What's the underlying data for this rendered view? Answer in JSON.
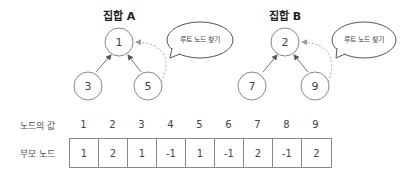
{
  "sets": [
    {
      "title": "집합 A",
      "root": "1",
      "children": [
        "3",
        "5"
      ],
      "bubble": "루트 노드 찾기"
    },
    {
      "title": "집합 B",
      "root": "2",
      "children": [
        "7",
        "9"
      ],
      "bubble": "루트 노드 찾기"
    }
  ],
  "table": {
    "index_label": "노드의 값",
    "parent_label": "부모 노드",
    "indices": [
      "1",
      "2",
      "3",
      "4",
      "5",
      "6",
      "7",
      "8",
      "9"
    ],
    "parents": [
      "1",
      "2",
      "1",
      "-1",
      "1",
      "-1",
      "2",
      "-1",
      "2"
    ]
  }
}
